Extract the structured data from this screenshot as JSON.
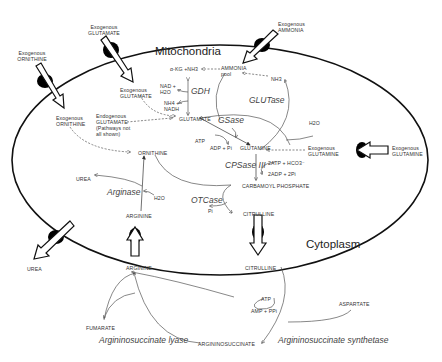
{
  "compartments": {
    "mitochondria": "Mitochondria",
    "cytoplasm": "Cytoplasm"
  },
  "transporters": [
    {
      "id": "exo-glutamate",
      "label_line1": "Exogenous",
      "label_line2": "GLUTAMATE",
      "direction": "in"
    },
    {
      "id": "exo-ornithine",
      "label_line1": "Exogenous",
      "label_line2": "ORNITHINE",
      "direction": "in"
    },
    {
      "id": "exo-ammonia",
      "label_line1": "Exogenous",
      "label_line2": "AMMONIA",
      "direction": "in"
    },
    {
      "id": "exo-glutamine",
      "label_line1": "Exogenous",
      "label_line2": "GLUTAMINE",
      "direction": "in"
    },
    {
      "id": "urea-out",
      "label": "UREA",
      "direction": "out"
    },
    {
      "id": "arginine-in",
      "label": "ARGININE",
      "direction": "in"
    },
    {
      "id": "citrulline-out",
      "label": "CITRULLINE",
      "direction": "out"
    }
  ],
  "metabolites": {
    "akg_nh3": "α-KG +NH3",
    "nad_h2o_1": "NAD +",
    "nad_h2o_2": "H2O",
    "nh4_nadh_1": "NH4 +",
    "nh4_nadh_2": "NADH",
    "ammonia_pool_1": "AMMONIA",
    "ammonia_pool_2": "pool",
    "nh3": "NH3",
    "glutamate": "GLUTAMATE",
    "glutamine": "GLUTAMINE",
    "h2o_glutase": "H2O",
    "atp": "ATP",
    "adp_pi": "ADP + Pi",
    "atp_hco3": "2ATP + HCO3⁻",
    "adp_pi_2": "2ADP + 2Pi",
    "carbamoyl_phosphate": "CARBAMOYL PHOSPHATE",
    "ornithine": "ORNITHINE",
    "citrulline_mito": "CITRULLINE",
    "pi": "Pi",
    "urea_mito": "UREA",
    "h2o_arginase": "H2O",
    "arginine_mito": "ARGININE",
    "exo_glutamate_inner_1": "Exogenous",
    "exo_glutamate_inner_2": "GLUTAMATE",
    "exo_ornithine_inner_1": "Exogenous",
    "exo_ornithine_inner_2": "ORNITHINE",
    "endo_glutamate_1": "Endogenous",
    "endo_glutamate_2": "GLUTAMATE",
    "endo_glutamate_3": "(Pathways not",
    "endo_glutamate_4": "all shown)",
    "exo_glutamine_inner_1": "Exogenous",
    "exo_glutamine_inner_2": "GLUTAMINE",
    "arginine_cyto": "ARGININE",
    "citrulline_cyto": "CITRULLINE",
    "fumarate": "FUMARATE",
    "argininosuccinate": "ARGININOSUCCINATE",
    "aspartate": "ASPARTATE",
    "atp_cyto": "ATP",
    "amp_ppi": "AMP + PPi"
  },
  "enzymes": {
    "gdh": "GDH",
    "glutase": "GLUTase",
    "gsase": "GSase",
    "cpsase": "CPSase III",
    "arginase": "Arginase",
    "otcase": "OTCase",
    "as_lyase": "Argininosuccinate lyase",
    "as_synthetase": "Argininosuccinate synthetase"
  }
}
